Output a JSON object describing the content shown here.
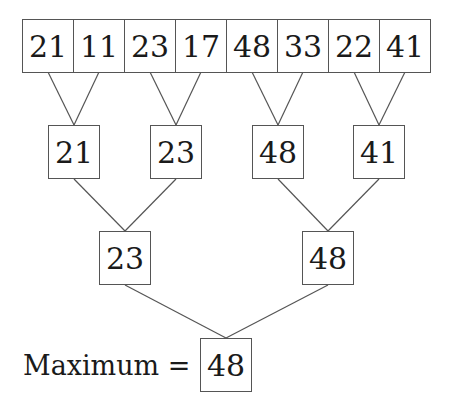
{
  "diagram": {
    "level0": [
      "21",
      "11",
      "23",
      "17",
      "48",
      "33",
      "22",
      "41"
    ],
    "level1": [
      "21",
      "23",
      "48",
      "41"
    ],
    "level2": [
      "23",
      "48"
    ],
    "result_label": "Maximum =",
    "result_value": "48",
    "colors": {
      "line": "#555555",
      "text": "#1a1a1a",
      "background": "#ffffff"
    }
  }
}
